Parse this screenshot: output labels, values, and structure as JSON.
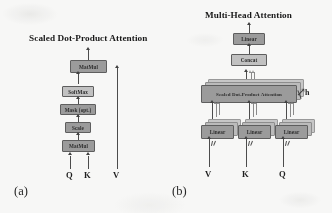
{
  "figure": {
    "panels": [
      {
        "key": "a",
        "caption": "(a)",
        "title": "Scaled Dot-Product Attention",
        "nodes": [
          {
            "id": "matmul-top",
            "label": "MatMul",
            "style": "dark"
          },
          {
            "id": "softmax",
            "label": "SoftMax",
            "style": "light"
          },
          {
            "id": "mask",
            "label": "Mask (opt.)",
            "style": "dark"
          },
          {
            "id": "scale",
            "label": "Scale",
            "style": "dark"
          },
          {
            "id": "matmul-bottom",
            "label": "MatMul",
            "style": "dark"
          }
        ],
        "inputs": [
          {
            "id": "input-q",
            "label": "Q"
          },
          {
            "id": "input-k",
            "label": "K"
          },
          {
            "id": "input-v",
            "label": "V"
          }
        ]
      },
      {
        "key": "b",
        "caption": "(b)",
        "title": "Multi-Head Attention",
        "nodes": [
          {
            "id": "linear-out",
            "label": "Linear",
            "style": "dark"
          },
          {
            "id": "concat",
            "label": "Concat",
            "style": "light"
          },
          {
            "id": "scaled-dot-product-attention",
            "label": "Scaled Dot-Product Attention",
            "style": "dark"
          },
          {
            "id": "linear-v",
            "label": "Linear",
            "style": "dark"
          },
          {
            "id": "linear-k",
            "label": "Linear",
            "style": "dark"
          },
          {
            "id": "linear-q",
            "label": "Linear",
            "style": "dark"
          }
        ],
        "inputs": [
          {
            "id": "input-v",
            "label": "V"
          },
          {
            "id": "input-k",
            "label": "K"
          },
          {
            "id": "input-q",
            "label": "Q"
          }
        ],
        "annotation": {
          "id": "heads-count",
          "label": "h"
        }
      }
    ],
    "colors": {
      "box_dark": "#9c9c9c",
      "box_light": "#c3c3c3",
      "box_stroke": "#5d5d5d",
      "connector": "#4a4a4a",
      "background": "#fbfbfa",
      "text": "#1a1a1a"
    }
  }
}
